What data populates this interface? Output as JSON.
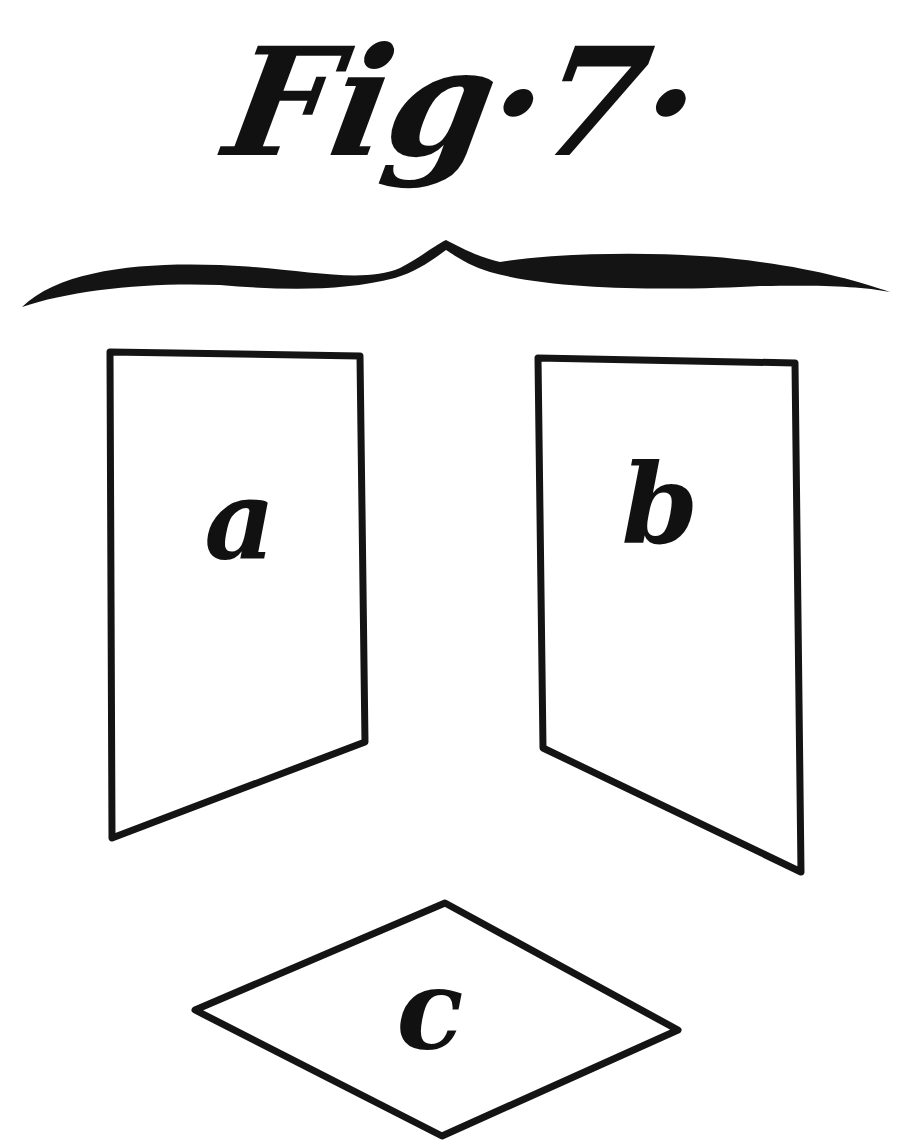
{
  "figure": {
    "title": "Fig·7",
    "title_trailing_dot": "·",
    "colors": {
      "ink": "#141414",
      "paper": "#ffffff"
    },
    "planes": [
      {
        "id": "a",
        "label": "a",
        "shape": "parallelogram (vertical, left)"
      },
      {
        "id": "b",
        "label": "b",
        "shape": "parallelogram (vertical, right)"
      },
      {
        "id": "c",
        "label": "c",
        "shape": "rhombus (horizontal, bottom)"
      }
    ]
  }
}
